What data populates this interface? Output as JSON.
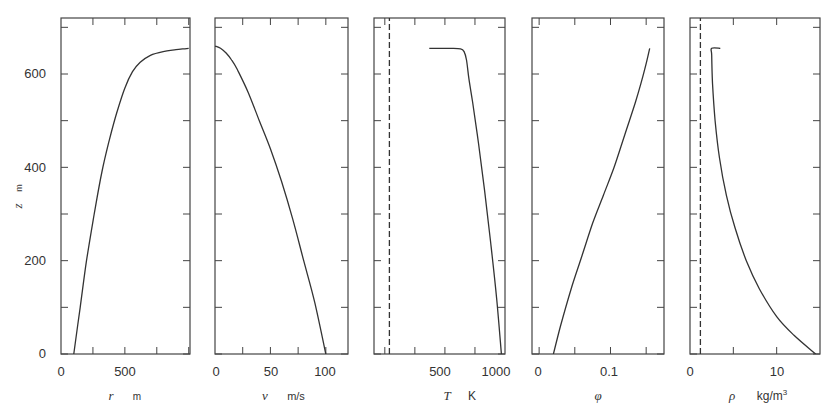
{
  "figure": {
    "ylabel_var": "z",
    "ylabel_unit": "m",
    "yticks": [
      "0",
      "200",
      "400",
      "600"
    ]
  },
  "chart_data": [
    {
      "type": "line",
      "title": "",
      "xlabel": "r   m",
      "ylabel": "z   m",
      "xlim": [
        0,
        1010
      ],
      "ylim": [
        0,
        720
      ],
      "xticks": [
        0,
        250,
        500,
        750,
        1000
      ],
      "xtick_labels": [
        "0",
        "",
        "500",
        "",
        ""
      ],
      "yticks": [
        0,
        100,
        200,
        300,
        400,
        500,
        600,
        700
      ],
      "ytick_labels": [
        "0",
        "",
        "200",
        "",
        "400",
        "",
        "600",
        ""
      ],
      "series": [
        {
          "name": "r",
          "style": "solid",
          "x": [
            100,
            150,
            200,
            260,
            320,
            380,
            440,
            500,
            560,
            620,
            700,
            800,
            900,
            1000
          ],
          "y": [
            0,
            100,
            200,
            300,
            390,
            460,
            520,
            570,
            605,
            625,
            640,
            648,
            652,
            655
          ]
        }
      ]
    },
    {
      "type": "line",
      "xlabel": "v   m/s",
      "xlim": [
        0,
        120
      ],
      "ylim": [
        0,
        720
      ],
      "xticks": [
        0,
        25,
        50,
        75,
        100
      ],
      "xtick_labels": [
        "0",
        "",
        "50",
        "",
        "100"
      ],
      "series": [
        {
          "name": "v",
          "style": "solid",
          "x": [
            0,
            5,
            10,
            15,
            20,
            30,
            40,
            50,
            60,
            70,
            80,
            90,
            100
          ],
          "y": [
            660,
            655,
            645,
            630,
            610,
            560,
            500,
            440,
            370,
            290,
            200,
            110,
            0
          ]
        }
      ]
    },
    {
      "type": "line",
      "xlabel": "T   K",
      "xlim": [
        160,
        1250
      ],
      "ylim": [
        0,
        720
      ],
      "xticks": [
        250,
        500,
        750,
        1000
      ],
      "xtick_labels": [
        "",
        "500",
        "",
        "1000"
      ],
      "series": [
        {
          "name": "T (plume)",
          "style": "solid",
          "x": [
            620,
            700,
            800,
            880,
            910,
            930,
            950,
            980,
            1030,
            1080,
            1130,
            1180,
            1220
          ],
          "y": [
            655,
            655,
            655,
            654,
            648,
            630,
            590,
            540,
            450,
            350,
            240,
            120,
            0
          ]
        },
        {
          "name": "T (ambient)",
          "style": "dashed",
          "x": [
            288,
            288
          ],
          "y": [
            0,
            720
          ]
        }
      ]
    },
    {
      "type": "line",
      "xlabel": "φ",
      "xlim": [
        -0.01,
        0.175
      ],
      "ylim": [
        0,
        720
      ],
      "xticks": [
        0,
        0.05,
        0.1,
        0.15
      ],
      "xtick_labels": [
        "0",
        "",
        "0.1",
        ""
      ],
      "series": [
        {
          "name": "phi",
          "style": "solid",
          "x": [
            0.02,
            0.03,
            0.045,
            0.06,
            0.075,
            0.09,
            0.105,
            0.12,
            0.135,
            0.148,
            0.155
          ],
          "y": [
            0,
            60,
            140,
            210,
            280,
            340,
            400,
            470,
            540,
            610,
            655
          ]
        }
      ]
    },
    {
      "type": "line",
      "xlabel": "ρ   kg/m³",
      "xlim": [
        0,
        15
      ],
      "ylim": [
        0,
        720
      ],
      "xticks": [
        0,
        5,
        10
      ],
      "xtick_labels": [
        "0",
        "",
        "10"
      ],
      "series": [
        {
          "name": "rho (plume)",
          "style": "solid",
          "x": [
            14.5,
            12,
            10,
            8,
            6.5,
            5.2,
            4.2,
            3.4,
            2.9,
            2.6,
            2.5,
            2.5,
            3.5
          ],
          "y": [
            0,
            40,
            80,
            140,
            200,
            270,
            340,
            420,
            500,
            580,
            640,
            655,
            655
          ]
        },
        {
          "name": "rho (ambient)",
          "style": "dashed",
          "x": [
            1.2,
            1.2
          ],
          "y": [
            0,
            720
          ]
        }
      ]
    }
  ],
  "panels": [
    {
      "x_var": "r",
      "x_unit": "m",
      "tick_labels": [
        "0",
        "500"
      ]
    },
    {
      "x_var": "v",
      "x_unit": "m/s",
      "tick_labels": [
        "0",
        "50",
        "100"
      ]
    },
    {
      "x_var": "T",
      "x_unit": "K",
      "tick_labels": [
        "500",
        "1000"
      ]
    },
    {
      "x_var": "φ",
      "x_unit": "",
      "tick_labels": [
        "0",
        "0.1"
      ]
    },
    {
      "x_var": "ρ",
      "x_unit": "kg/m",
      "x_unit_sup": "3",
      "tick_labels": [
        "0",
        "10"
      ]
    }
  ],
  "colors": {
    "line": "#333333",
    "frame": "#444444",
    "background": "#ffffff"
  }
}
